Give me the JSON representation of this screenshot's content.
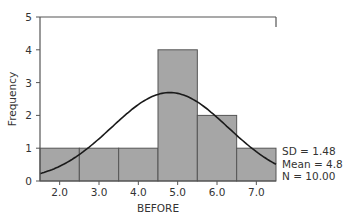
{
  "chart_data": {
    "type": "bar",
    "subtype": "histogram_with_normal_curve",
    "title": "",
    "xlabel": "BEFORE",
    "ylabel": "Frequency",
    "bins": [
      {
        "from": 1.5,
        "to": 2.5,
        "count": 1
      },
      {
        "from": 2.5,
        "to": 3.5,
        "count": 1
      },
      {
        "from": 3.5,
        "to": 4.5,
        "count": 1
      },
      {
        "from": 4.5,
        "to": 5.5,
        "count": 4
      },
      {
        "from": 5.5,
        "to": 6.5,
        "count": 2
      },
      {
        "from": 6.5,
        "to": 7.5,
        "count": 1
      }
    ],
    "categories": [
      "2.0",
      "3.0",
      "4.0",
      "5.0",
      "6.0",
      "7.0"
    ],
    "values": [
      1,
      1,
      1,
      4,
      2,
      1
    ],
    "x_ticks": [
      "2.0",
      "3.0",
      "4.0",
      "5.0",
      "6.0",
      "7.0"
    ],
    "y_ticks": [
      "0",
      "1",
      "2",
      "3",
      "4",
      "5"
    ],
    "xlim": [
      1.5,
      7.5
    ],
    "ylim": [
      0,
      5
    ],
    "grid": false,
    "normal_curve": {
      "mean": 4.8,
      "sd": 1.48,
      "n": 10
    },
    "stats": {
      "sd_label": "SD = 1.48",
      "mean_label": "Mean = 4.8",
      "n_label": "N = 10.00"
    },
    "colors": {
      "bar_fill": "#a6a6a6",
      "bar_stroke": "#555555",
      "curve": "#1a1a1a",
      "axis": "#555555"
    }
  }
}
